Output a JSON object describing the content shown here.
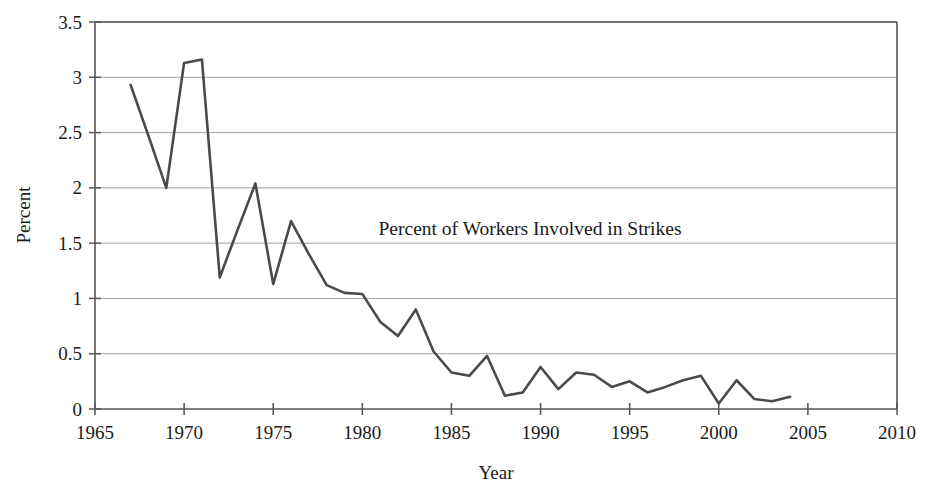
{
  "chart_data": {
    "type": "line",
    "title": "",
    "annotation": "Percent of Workers Involved in Strikes",
    "xlabel": "Year",
    "ylabel": "Percent",
    "xlim": [
      1965,
      2010
    ],
    "ylim": [
      0,
      3.5
    ],
    "grid": true,
    "legend": "none",
    "xticks": [
      1965,
      1970,
      1975,
      1980,
      1985,
      1990,
      1995,
      2000,
      2005,
      2010
    ],
    "xticklabels": [
      "1965",
      "1970",
      "1975",
      "1980",
      "1985",
      "1990",
      "1995",
      "2000",
      "2005",
      "2010"
    ],
    "yticks": [
      0,
      0.5,
      1,
      1.5,
      2,
      2.5,
      3,
      3.5
    ],
    "yticklabels": [
      "0",
      "0.5",
      "1",
      "1.5",
      "2",
      "2.5",
      "3",
      "3.5"
    ],
    "series": [
      {
        "name": "Percent of Workers Involved in Strikes",
        "color": "#4a4a4a",
        "x": [
          1967,
          1968,
          1969,
          1970,
          1971,
          1972,
          1973,
          1974,
          1975,
          1976,
          1977,
          1978,
          1979,
          1980,
          1981,
          1982,
          1983,
          1984,
          1985,
          1986,
          1987,
          1988,
          1989,
          1990,
          1991,
          1992,
          1993,
          1994,
          1995,
          1996,
          1997,
          1998,
          1999,
          2000,
          2001,
          2002,
          2003,
          2004
        ],
        "values": [
          2.93,
          2.47,
          2.0,
          3.13,
          3.16,
          1.19,
          1.62,
          2.04,
          1.13,
          1.7,
          1.4,
          1.12,
          1.05,
          1.04,
          0.79,
          0.66,
          0.9,
          0.52,
          0.33,
          0.3,
          0.48,
          0.12,
          0.15,
          0.38,
          0.18,
          0.33,
          0.31,
          0.2,
          0.25,
          0.15,
          0.2,
          0.26,
          0.3,
          0.05,
          0.26,
          0.09,
          0.07,
          0.11
        ]
      }
    ]
  },
  "figure": {
    "background_color": "#ffffff",
    "line_color": "#4a4a4a",
    "grid_color": "#9a9a9a",
    "axis_color": "#555555"
  }
}
